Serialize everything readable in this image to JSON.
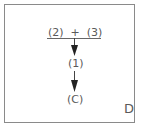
{
  "diagram": {
    "top_expression": "(2)  +  (3)",
    "middle_node": "(1)",
    "bottom_node": "(C)",
    "panel_label": "D",
    "colors": {
      "stroke": "#555555",
      "frame": "#8a8a8a"
    }
  }
}
